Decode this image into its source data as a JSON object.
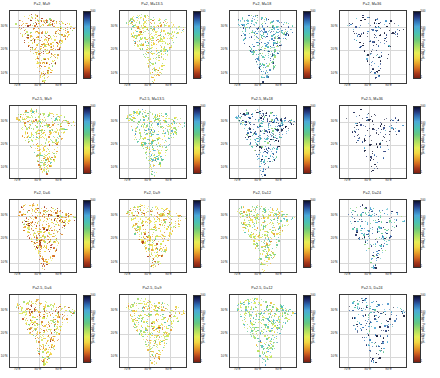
{
  "figure": {
    "type": "map-grid",
    "rows": 4,
    "cols": 4,
    "region": "India"
  },
  "axis": {
    "xticks": [
      "70°E",
      "80°E",
      "90°E"
    ],
    "xtick_values": [
      70,
      80,
      90
    ],
    "yticks": [
      "30°N",
      "20°N",
      "10°N"
    ],
    "ytick_values": [
      30,
      20,
      10
    ],
    "xlim": [
      66,
      98
    ],
    "ylim": [
      6,
      37
    ]
  },
  "colorbar": {
    "label": "Return Period (Years)",
    "ticks": [
      "500",
      "100",
      "50",
      "20",
      "10",
      "5",
      "1"
    ],
    "tick_values": [
      500,
      100,
      50,
      20,
      10,
      5,
      1
    ],
    "scale": "log",
    "vmin": 1,
    "vmax": 500,
    "colors": [
      "#0b1030",
      "#22357a",
      "#2f6fb5",
      "#4aa8d8",
      "#49c2b4",
      "#68c97e",
      "#a8de62",
      "#e6ee55",
      "#f2d742",
      "#e8a32a",
      "#d4691f",
      "#a8381a",
      "#7a1f12"
    ]
  },
  "panels": [
    {
      "id": "r1c1",
      "title": "P=2, M=9",
      "P": 2,
      "param": "M",
      "value": 9,
      "dominant_color": "#e8d93f",
      "density": 1.0,
      "mean_return_period": 6
    },
    {
      "id": "r1c2",
      "title": "P=2, M=13.5",
      "P": 2,
      "param": "M",
      "value": 13.5,
      "dominant_color": "#7ec864",
      "density": 1.0,
      "mean_return_period": 14
    },
    {
      "id": "r1c3",
      "title": "P=2, M=18",
      "P": 2,
      "param": "M",
      "value": 18,
      "dominant_color": "#2a5c9a",
      "density": 0.9,
      "mean_return_period": 90
    },
    {
      "id": "r1c4",
      "title": "P=2, M=36",
      "P": 2,
      "param": "M",
      "value": 36,
      "dominant_color": "#1a2a66",
      "density": 0.35,
      "mean_return_period": 400
    },
    {
      "id": "r2c1",
      "title": "P=2.5, M=9",
      "P": 2.5,
      "param": "M",
      "value": 9,
      "dominant_color": "#a9db5c",
      "density": 1.0,
      "mean_return_period": 11
    },
    {
      "id": "r2c2",
      "title": "P=2.5, M=13.5",
      "P": 2.5,
      "param": "M",
      "value": 13.5,
      "dominant_color": "#5ec58e",
      "density": 1.0,
      "mean_return_period": 25
    },
    {
      "id": "r2c3",
      "title": "P=2.5, M=18",
      "P": 2.5,
      "param": "M",
      "value": 18,
      "dominant_color": "#23406f",
      "density": 0.85,
      "mean_return_period": 150
    },
    {
      "id": "r2c4",
      "title": "P=2.5, M=36",
      "P": 2.5,
      "param": "M",
      "value": 36,
      "dominant_color": "#1a2a66",
      "density": 0.3,
      "mean_return_period": 450
    },
    {
      "id": "r3c1",
      "title": "P=2, D=6",
      "P": 2,
      "param": "D",
      "value": 6,
      "dominant_color": "#f0c63a",
      "density": 1.0,
      "mean_return_period": 5
    },
    {
      "id": "r3c2",
      "title": "P=2, D=9",
      "P": 2,
      "param": "D",
      "value": 9,
      "dominant_color": "#b7de55",
      "density": 1.0,
      "mean_return_period": 9
    },
    {
      "id": "r3c3",
      "title": "P=2, D=12",
      "P": 2,
      "param": "D",
      "value": 12,
      "dominant_color": "#79c97a",
      "density": 1.0,
      "mean_return_period": 18
    },
    {
      "id": "r3c4",
      "title": "P=2, D=24",
      "P": 2,
      "param": "D",
      "value": 24,
      "dominant_color": "#3f7fb8",
      "density": 0.5,
      "mean_return_period": 120
    },
    {
      "id": "r4c1",
      "title": "P=2.5, D=6",
      "P": 2.5,
      "param": "D",
      "value": 6,
      "dominant_color": "#d9e24b",
      "density": 1.0,
      "mean_return_period": 8
    },
    {
      "id": "r4c2",
      "title": "P=2.5, D=9",
      "P": 2.5,
      "param": "D",
      "value": 9,
      "dominant_color": "#9ad85f",
      "density": 1.0,
      "mean_return_period": 13
    },
    {
      "id": "r4c3",
      "title": "P=2.5, D=12",
      "P": 2.5,
      "param": "D",
      "value": 12,
      "dominant_color": "#4fc0a2",
      "density": 1.0,
      "mean_return_period": 30
    },
    {
      "id": "r4c4",
      "title": "P=2.5, D=24",
      "P": 2.5,
      "param": "D",
      "value": 24,
      "dominant_color": "#2f6fb5",
      "density": 0.45,
      "mean_return_period": 200
    }
  ]
}
